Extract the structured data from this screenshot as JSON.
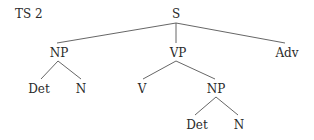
{
  "diagram": {
    "title": "TS 2",
    "type": "syntax-tree",
    "nodes": {
      "s": "S",
      "np1": "NP",
      "vp": "VP",
      "adv": "Adv",
      "det1": "Det",
      "n1": "N",
      "v": "V",
      "np2": "NP",
      "det2": "Det",
      "n2": "N"
    },
    "edges": [
      [
        "S",
        "NP"
      ],
      [
        "S",
        "VP"
      ],
      [
        "S",
        "Adv"
      ],
      [
        "NP",
        "Det"
      ],
      [
        "NP",
        "N"
      ],
      [
        "VP",
        "V"
      ],
      [
        "VP",
        "NP"
      ],
      [
        "NP",
        "Det"
      ],
      [
        "NP",
        "N"
      ]
    ],
    "line_color": "#555555"
  }
}
